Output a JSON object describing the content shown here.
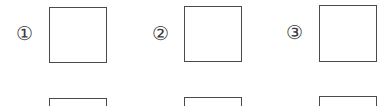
{
  "items": [
    {
      "label": "①"
    },
    {
      "label": "②"
    },
    {
      "label": "③"
    }
  ],
  "second_row_labels": [
    "",
    "",
    ""
  ]
}
